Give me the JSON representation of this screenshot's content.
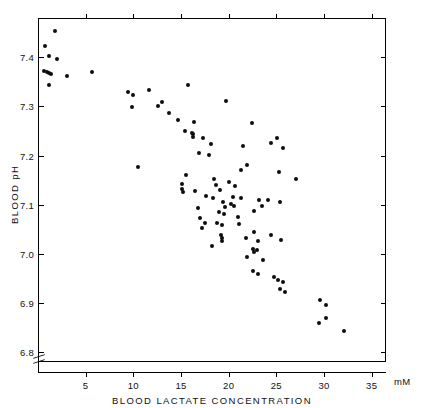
{
  "figure": {
    "background": "#ffffff",
    "marker_color": "#0d0d0d",
    "axis_color": "#000000"
  },
  "axes": {
    "x_title": "BLOOD  LACTATE  CONCENTRATION",
    "x_unit": "mM",
    "y_title": "BLOOD  pH",
    "x_ticks": [
      "5",
      "10",
      "15",
      "20",
      "25",
      "30",
      "35"
    ],
    "y_ticks": [
      "7.4",
      "7.3",
      "7.2",
      "7.1",
      "7.0",
      "6.9",
      "6.8"
    ],
    "y_axis_break": true
  },
  "chart_data": {
    "type": "scatter",
    "title": "",
    "xlabel": "BLOOD LACTATE CONCENTRATION",
    "ylabel": "BLOOD pH",
    "x_unit": "mM",
    "xlim": [
      0,
      36.5
    ],
    "ylim": [
      6.78,
      7.48
    ],
    "xticks": [
      5,
      10,
      15,
      20,
      25,
      30,
      35
    ],
    "yticks": [
      7.4,
      7.3,
      7.2,
      7.1,
      7.0,
      6.9,
      6.8
    ],
    "grid": false,
    "legend": null,
    "series": [
      {
        "name": "subjects",
        "marker": "filled-circle",
        "color": "#0d0d0d",
        "points": [
          [
            1.7,
            7.455
          ],
          [
            0.6,
            7.425
          ],
          [
            1.1,
            7.405
          ],
          [
            1.9,
            7.398
          ],
          [
            0.5,
            7.375
          ],
          [
            0.85,
            7.372
          ],
          [
            1.0,
            7.37
          ],
          [
            1.25,
            7.368
          ],
          [
            2.9,
            7.365
          ],
          [
            1.1,
            7.345
          ],
          [
            5.6,
            7.372
          ],
          [
            9.3,
            7.332
          ],
          [
            9.9,
            7.325
          ],
          [
            11.5,
            7.335
          ],
          [
            15.6,
            7.345
          ],
          [
            9.75,
            7.3
          ],
          [
            12.9,
            7.312
          ],
          [
            19.6,
            7.313
          ],
          [
            12.5,
            7.303
          ],
          [
            13.6,
            7.288
          ],
          [
            14.6,
            7.275
          ],
          [
            16.3,
            7.27
          ],
          [
            22.3,
            7.268
          ],
          [
            15.3,
            7.252
          ],
          [
            16.0,
            7.248
          ],
          [
            16.2,
            7.245
          ],
          [
            16.15,
            7.24
          ],
          [
            17.2,
            7.238
          ],
          [
            25.0,
            7.238
          ],
          [
            18.0,
            7.225
          ],
          [
            21.4,
            7.222
          ],
          [
            24.3,
            7.228
          ],
          [
            25.6,
            7.218
          ],
          [
            16.8,
            7.207
          ],
          [
            17.8,
            7.203
          ],
          [
            10.4,
            7.178
          ],
          [
            21.8,
            7.182
          ],
          [
            21.2,
            7.172
          ],
          [
            25.2,
            7.168
          ],
          [
            27.0,
            7.155
          ],
          [
            15.4,
            7.162
          ],
          [
            15.0,
            7.145
          ],
          [
            15.05,
            7.135
          ],
          [
            15.1,
            7.128
          ],
          [
            16.4,
            7.13
          ],
          [
            17.5,
            7.12
          ],
          [
            18.2,
            7.115
          ],
          [
            20.4,
            7.118
          ],
          [
            21.2,
            7.115
          ],
          [
            24.0,
            7.112
          ],
          [
            25.3,
            7.108
          ],
          [
            16.7,
            7.095
          ],
          [
            19.5,
            7.098
          ],
          [
            22.6,
            7.09
          ],
          [
            16.9,
            7.075
          ],
          [
            17.4,
            7.065
          ],
          [
            23.1,
            7.112
          ],
          [
            23.4,
            7.1
          ],
          [
            17.1,
            7.055
          ],
          [
            18.4,
            7.155
          ],
          [
            18.6,
            7.142
          ],
          [
            19.0,
            7.133
          ],
          [
            19.9,
            7.148
          ],
          [
            20.6,
            7.14
          ],
          [
            19.3,
            7.108
          ],
          [
            20.1,
            7.103
          ],
          [
            20.5,
            7.1
          ],
          [
            18.9,
            7.088
          ],
          [
            19.4,
            7.083
          ],
          [
            20.9,
            7.078
          ],
          [
            18.7,
            7.065
          ],
          [
            19.2,
            7.06
          ],
          [
            21.0,
            7.062
          ],
          [
            19.1,
            7.04
          ],
          [
            19.15,
            7.034
          ],
          [
            19.2,
            7.028
          ],
          [
            18.1,
            7.018
          ],
          [
            21.7,
            7.035
          ],
          [
            22.6,
            7.047
          ],
          [
            23.0,
            7.028
          ],
          [
            22.4,
            7.012
          ],
          [
            22.5,
            7.006
          ],
          [
            22.9,
            7.01
          ],
          [
            24.3,
            7.04
          ],
          [
            25.4,
            7.03
          ],
          [
            21.8,
            6.995
          ],
          [
            23.5,
            6.99
          ],
          [
            22.4,
            6.968
          ],
          [
            23.0,
            6.962
          ],
          [
            24.7,
            6.955
          ],
          [
            25.1,
            6.948
          ],
          [
            25.6,
            6.945
          ],
          [
            25.3,
            6.93
          ],
          [
            25.8,
            6.925
          ],
          [
            29.5,
            6.908
          ],
          [
            30.1,
            6.898
          ],
          [
            29.4,
            6.862
          ],
          [
            30.1,
            6.872
          ],
          [
            32.0,
            6.845
          ]
        ]
      }
    ]
  }
}
